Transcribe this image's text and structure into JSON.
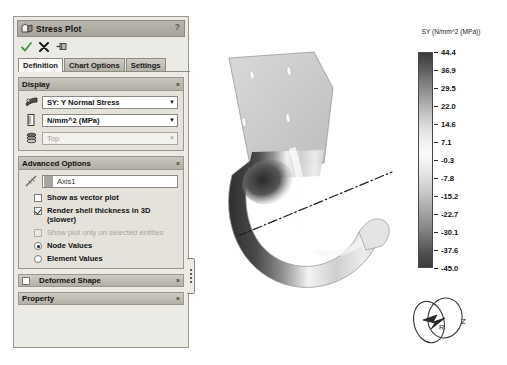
{
  "panel": {
    "title": "Stress Plot",
    "title_icon": "stress-plot-icon",
    "help_label": "?",
    "actions": [
      {
        "name": "accept-button",
        "icon": "green-check-icon",
        "label": "OK"
      },
      {
        "name": "cancel-button",
        "icon": "black-x-icon",
        "label": "Cancel"
      },
      {
        "name": "pin-button",
        "icon": "pushpin-icon",
        "label": "Keep Visible"
      }
    ],
    "tabs": [
      {
        "label": "Definition",
        "active": true
      },
      {
        "label": "Chart Options",
        "active": false
      },
      {
        "label": "Settings",
        "active": false
      }
    ],
    "display": {
      "header": "Display",
      "collapse_glyph": "«",
      "fields": [
        {
          "icon": "stress-component-icon",
          "value": "SY: Y Normal Stress",
          "arrow": "▼",
          "disabled": false
        },
        {
          "icon": "units-ruler-icon",
          "value": "N/mm^2 (MPa)",
          "arrow": "▼",
          "disabled": false
        },
        {
          "icon": "shell-face-icon",
          "value": "Top",
          "arrow": "▼",
          "disabled": true
        }
      ]
    },
    "advanced": {
      "header": "Advanced Options",
      "collapse_glyph": "«",
      "axis_icon": "reference-axis-icon",
      "axis_value": "Axis1",
      "options": [
        {
          "type": "checkbox",
          "label": "Show as vector plot",
          "checked": false,
          "disabled": false
        },
        {
          "type": "checkbox",
          "label": "Render shell thickness in 3D (slower)",
          "checked": true,
          "disabled": false
        },
        {
          "type": "checkbox",
          "label": "Show plot only on selected entities",
          "checked": false,
          "disabled": true
        },
        {
          "type": "radio",
          "label": "Node Values",
          "checked": true,
          "disabled": false
        },
        {
          "type": "radio",
          "label": "Element Values",
          "checked": false,
          "disabled": false
        }
      ]
    },
    "deformed_shape": {
      "label": "Deformed Shape",
      "checked": false,
      "expand_glyph": "»"
    },
    "property": {
      "label": "Property",
      "expand_glyph": "»"
    }
  },
  "viewport": {
    "annotation": "Axis1",
    "triad": {
      "z_label": "Z",
      "r_label": "R"
    }
  },
  "chart_data": {
    "type": "heatmap",
    "title": "SY (N/mm^2 (MPa))",
    "colormap": "greyscale",
    "legend_position": "right",
    "orientation": "vertical",
    "ylim": [
      -45.0,
      44.4
    ],
    "tick_labels": [
      "44.4",
      "36.9",
      "29.5",
      "22.0",
      "14.6",
      "7.1",
      "-0.3",
      "-7.8",
      "-15.2",
      "-22.7",
      "-30.1",
      "-37.6",
      "-45.0"
    ],
    "values": [
      44.4,
      36.9,
      29.5,
      22.0,
      14.6,
      7.1,
      -0.3,
      -7.8,
      -15.2,
      -22.7,
      -30.1,
      -37.6,
      -45.0
    ],
    "xlabel": "",
    "ylabel": "SY (N/mm^2 (MPa))",
    "grid": false
  }
}
